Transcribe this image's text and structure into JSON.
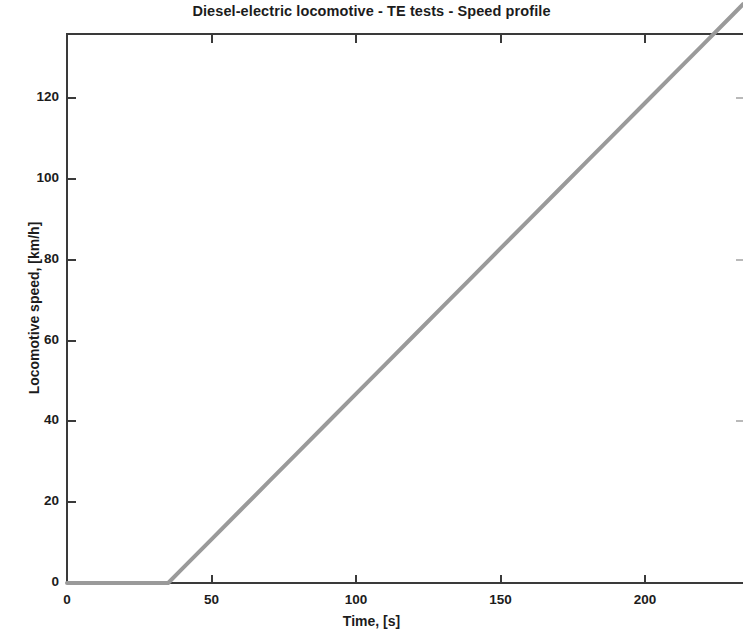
{
  "chart": {
    "title": "Diesel-electric locomotive - TE tests - Speed profile",
    "xlabel": "Time, [s]",
    "ylabel": "Locomotive speed, [km/h]"
  },
  "axes": {
    "x_ticks": [
      "0",
      "50",
      "100",
      "150",
      "200"
    ],
    "y_ticks": [
      "0",
      "20",
      "40",
      "60",
      "80",
      "100",
      "120"
    ]
  },
  "colors": {
    "line": "#9a9a9a",
    "axis": "#3a3a3a",
    "text": "#1c1c1c",
    "background": "#ffffff"
  },
  "chart_data": {
    "type": "line",
    "title": "Diesel-electric locomotive - TE tests - Speed profile",
    "xlabel": "Time, [s]",
    "ylabel": "Locomotive speed, [km/h]",
    "xlim": [
      0,
      234
    ],
    "ylim": [
      0,
      136
    ],
    "xticks": [
      0,
      50,
      100,
      150,
      200
    ],
    "yticks": [
      0,
      20,
      40,
      60,
      80,
      100,
      120
    ],
    "grid": false,
    "legend": null,
    "series": [
      {
        "name": "Locomotive speed",
        "color": "#9a9a9a",
        "linewidth": 4,
        "x": [
          0,
          5,
          10,
          15,
          20,
          25,
          30,
          35,
          40,
          50,
          60,
          70,
          80,
          90,
          100,
          110,
          120,
          130,
          140,
          150,
          160,
          170,
          180,
          190,
          200,
          210,
          220,
          230,
          234
        ],
        "y": [
          0,
          0,
          0,
          0,
          0,
          0,
          0,
          0,
          3.6,
          10.8,
          18.0,
          25.2,
          32.4,
          39.6,
          46.8,
          54.0,
          61.2,
          68.4,
          75.6,
          82.8,
          90.0,
          97.2,
          104.4,
          111.6,
          118.8,
          126.0,
          133.2,
          140.4,
          143.3
        ]
      }
    ],
    "annotations": [
      "Speed is zero until t = 35 s, then rises linearly at about 0.72 km/h per second",
      "Plot is cropped at the right edge of the image"
    ]
  }
}
